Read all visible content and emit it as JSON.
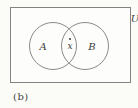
{
  "figure": {
    "universal_set_label": "U",
    "set_a_label": "A",
    "set_b_label": "B",
    "intersection_point_label": "x",
    "caption": "(b)",
    "colors": {
      "background": "#fbfbf8",
      "box_border": "#838383",
      "circle_border": "#8a8a8a",
      "text": "#3c3c3c"
    }
  }
}
